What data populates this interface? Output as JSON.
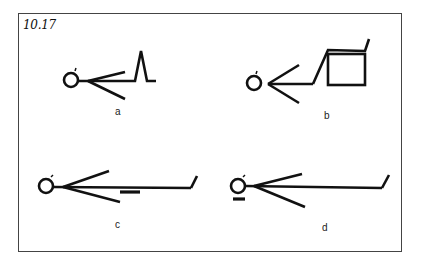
{
  "figure": {
    "number": "10.17",
    "panels": [
      {
        "id": "a",
        "label": "a",
        "description": "Supine figure, knees bent with one leg raised in a peak"
      },
      {
        "id": "b",
        "label": "b",
        "description": "Supine figure with lower legs resting on a box"
      },
      {
        "id": "c",
        "label": "c",
        "description": "Supine figure, legs extended, support bar under thighs/knees"
      },
      {
        "id": "d",
        "label": "d",
        "description": "Supine figure, legs extended, support bar under head"
      }
    ]
  },
  "colors": {
    "stroke": "#111111",
    "frame": "#444444",
    "background": "#ffffff"
  }
}
